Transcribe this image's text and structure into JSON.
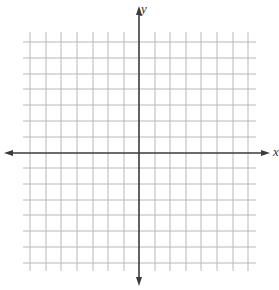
{
  "diagram": {
    "type": "coordinate-plane",
    "x_axis_label": "x",
    "y_axis_label": "y",
    "grid": {
      "columns": 14,
      "rows": 15,
      "spacing_px": 15.6,
      "origin_px": [
        139,
        153
      ],
      "vertical_lines_px": [
        30,
        46,
        61,
        77,
        93,
        108,
        124,
        155,
        170,
        186,
        201,
        217,
        233,
        248
      ],
      "horizontal_lines_px": [
        42,
        58,
        74,
        89,
        105,
        121,
        137,
        168,
        184,
        200,
        215,
        231,
        247,
        263
      ],
      "extent_px": {
        "left": 23,
        "right": 256,
        "top": 32,
        "bottom": 271
      }
    },
    "colors": {
      "grid": "#b8b8b8",
      "axis": "#3a3a3a",
      "background": "#ffffff"
    }
  }
}
